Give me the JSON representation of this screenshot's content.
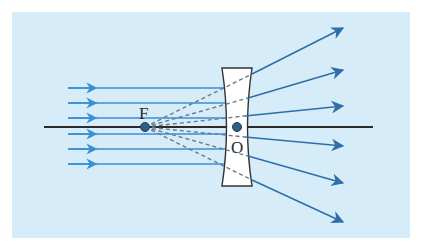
{
  "diagram": {
    "labels": {
      "focus": "F",
      "optical_center": "O"
    },
    "colors": {
      "background_panel": "#d6ecf8",
      "incident_ray": "#3a8fd6",
      "refracted_ray": "#2f6fa8",
      "virtual_ray": "#6a7b8c",
      "axis": "#2b2b2b",
      "lens_fill": "#ffffff",
      "lens_stroke": "#333333",
      "point": "#2e5f85"
    },
    "incident_rays_y": [
      88,
      103,
      118,
      134,
      149,
      164
    ],
    "refracted_ray_tips": [
      {
        "x": 343,
        "y": 28
      },
      {
        "x": 343,
        "y": 70
      },
      {
        "x": 343,
        "y": 106
      },
      {
        "x": 343,
        "y": 146
      },
      {
        "x": 343,
        "y": 183
      },
      {
        "x": 343,
        "y": 222
      }
    ],
    "focus_point": {
      "x": 145,
      "y": 127
    },
    "optical_center_point": {
      "x": 237,
      "y": 127
    }
  }
}
